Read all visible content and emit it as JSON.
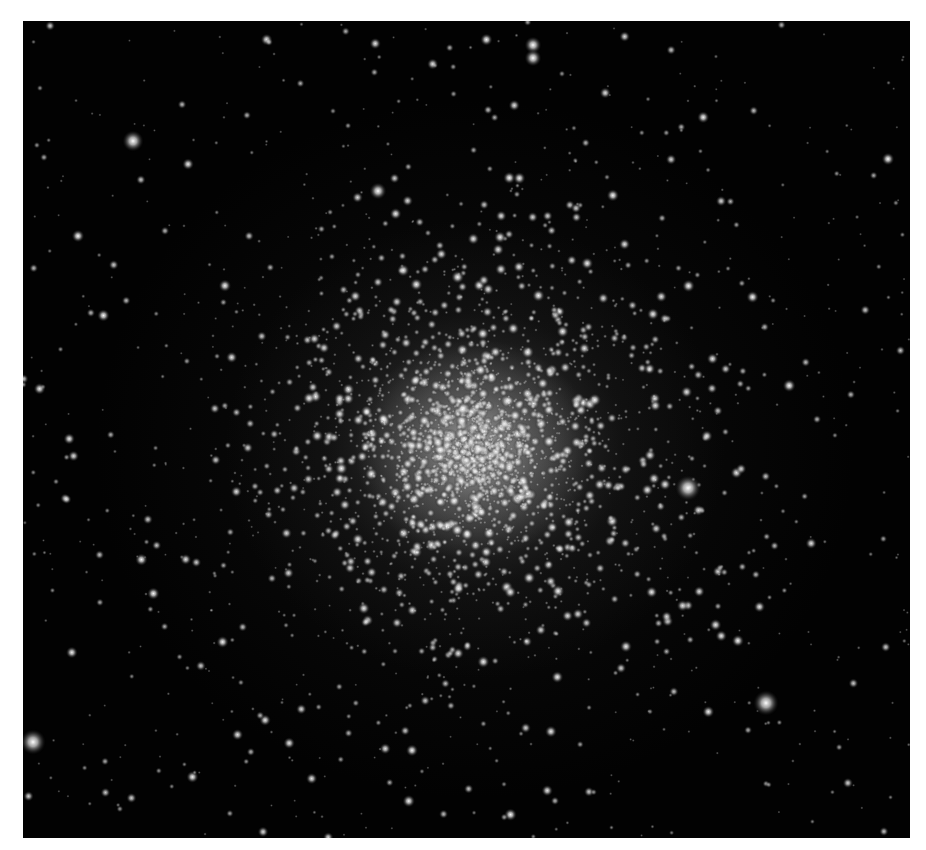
{
  "image": {
    "subject": "globular star cluster",
    "background_color": "#020202",
    "frame_color": "#ffffff",
    "cluster_center": [
      452,
      428
    ],
    "cluster_core_radius": 120,
    "cluster_halo_radius": 330,
    "seed": 20240611,
    "field_star_count": 700,
    "cluster_star_count": 2600,
    "bright_stars": [
      {
        "x": 743,
        "y": 682,
        "r": 6
      },
      {
        "x": 665,
        "y": 467,
        "r": 6
      },
      {
        "x": 10,
        "y": 721,
        "r": 6
      },
      {
        "x": 110,
        "y": 120,
        "r": 5
      },
      {
        "x": 510,
        "y": 24,
        "r": 4
      },
      {
        "x": 510,
        "y": 37,
        "r": 4
      },
      {
        "x": 55,
        "y": 215,
        "r": 3
      },
      {
        "x": 355,
        "y": 170,
        "r": 4
      },
      {
        "x": 865,
        "y": 138,
        "r": 3
      }
    ]
  }
}
